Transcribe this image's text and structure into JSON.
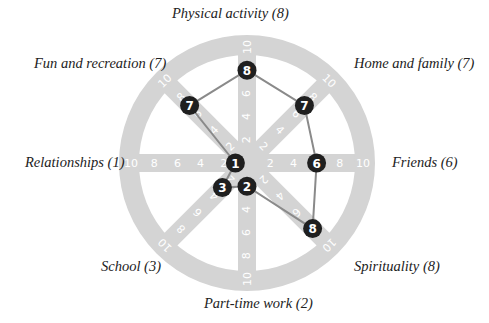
{
  "chart_data": {
    "type": "radar",
    "title": "",
    "scale": {
      "min": 0,
      "max": 10,
      "ticks": [
        2,
        4,
        6,
        8,
        10
      ]
    },
    "categories": [
      "Physical activity",
      "Home and family",
      "Friends",
      "Spirituality",
      "Part-time work",
      "School",
      "Relationships",
      "Fun and recreation"
    ],
    "values": [
      8,
      7,
      6,
      8,
      2,
      3,
      1,
      7
    ],
    "labels": [
      "Physical activity (8)",
      "Home and family (7)",
      "Friends (6)",
      "Spirituality (8)",
      "Part-time work (2)",
      "School (3)",
      "Relationships (1)",
      "Fun and recreation (7)"
    ],
    "colors": {
      "wheel": "#d4d4d4",
      "tick_text": "#ffffff",
      "line": "#8a8a8a",
      "marker": "#1f1f1f",
      "marker_text": "#ffffff",
      "label_text": "#222222"
    }
  }
}
